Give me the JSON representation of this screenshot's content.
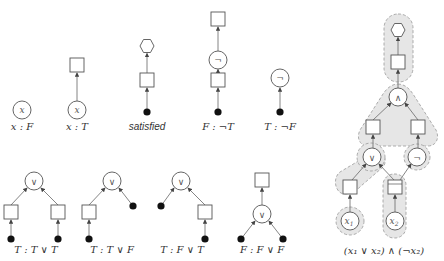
{
  "colors": {
    "stroke": "#555555",
    "node_fill": "#ffffff",
    "dot": "#111111",
    "group_fill": "#e6e6e6",
    "group_stroke": "#999999",
    "text": "#333333"
  },
  "glyphs": {
    "or": "∨",
    "and": "∧",
    "not": "¬",
    "x": "x",
    "x1": "x",
    "x1_sub": "1",
    "x2": "x",
    "x2_sub": "2"
  },
  "examples": {
    "var_false": {
      "label": "x : F",
      "node": "x"
    },
    "var_true": {
      "label": "x : T",
      "node": "x"
    },
    "satisfied": {
      "label": "satisfied"
    },
    "not_true": {
      "label": "F : ¬T"
    },
    "not_false": {
      "label": "T : ¬F"
    },
    "or_tt": {
      "label": "T : T ∨ T"
    },
    "or_tf": {
      "label": "T : T ∨ F"
    },
    "or_ft": {
      "label": "T : F ∨ T"
    },
    "or_ff": {
      "label": "F : F ∨ F"
    }
  },
  "composite": {
    "caption": "(x₁ ∨ x₂) ∧ (¬x₂)"
  }
}
